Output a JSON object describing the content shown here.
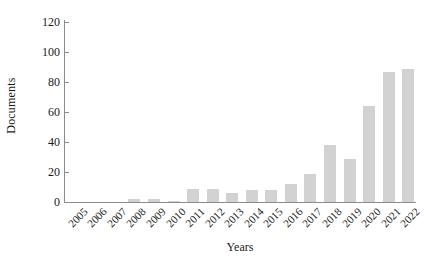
{
  "chart_data": {
    "type": "bar",
    "title": "",
    "xlabel": "Years",
    "ylabel": "Documents",
    "categories": [
      "2005",
      "2006",
      "2007",
      "2008",
      "2009",
      "2010",
      "2011",
      "2012",
      "2013",
      "2014",
      "2015",
      "2016",
      "2017",
      "2018",
      "2019",
      "2020",
      "2021",
      "2022"
    ],
    "values": [
      0,
      0,
      0,
      2,
      2,
      1,
      9,
      9,
      6,
      8,
      8,
      12,
      19,
      38,
      29,
      64,
      87,
      89
    ],
    "ylim": [
      0,
      120
    ],
    "yticks": [
      0,
      20,
      40,
      60,
      80,
      100,
      120
    ],
    "ytick_labels": [
      "0",
      "20",
      "40",
      "60",
      "80",
      "100",
      "120"
    ],
    "grid": false,
    "legend": false,
    "bar_color": "#d2d2d2",
    "axis_color": "#8c8c8c",
    "text_color": "#1a1a1a"
  }
}
